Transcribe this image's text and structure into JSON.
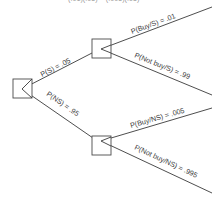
{
  "diagram": {
    "type": "probability-tree",
    "top_cut_text": "(.01)(.05) = (.005)(.95)",
    "root": {
      "id": "root"
    },
    "branches": [
      {
        "id": "S",
        "label": "P(S) = .05"
      },
      {
        "id": "NS",
        "label": "P(NS) = .95"
      }
    ],
    "leaves": [
      {
        "parent": "S",
        "label": "P(Buy/S) = .01"
      },
      {
        "parent": "S",
        "label": "P(Not buy/S) = .99"
      },
      {
        "parent": "NS",
        "label": "P(Buy/NS) = .005"
      },
      {
        "parent": "NS",
        "label": "P(Not buy/NS) = .995"
      }
    ],
    "colors": {
      "line": "#3a3a3a",
      "text": "#3c3c3c",
      "background": "#ffffff"
    }
  }
}
